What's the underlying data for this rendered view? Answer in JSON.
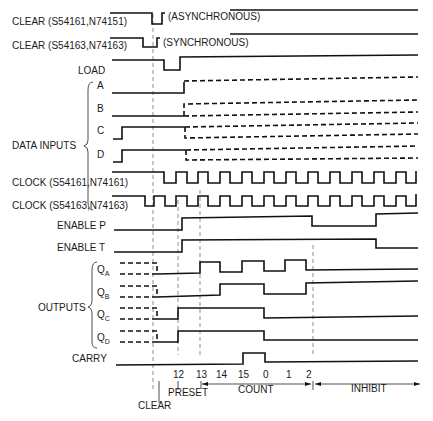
{
  "signals": {
    "clear_async": {
      "label": "CLEAR (S54161,N74151)",
      "note": "(ASYNCHRONOUS)"
    },
    "clear_sync": {
      "label": "CLEAR (S54163,N74163)",
      "note": "(SYNCHRONOUS)"
    },
    "load": {
      "label": "LOAD"
    },
    "data_inputs": {
      "group_label": "DATA INPUTS",
      "items": [
        "A",
        "B",
        "C",
        "D"
      ]
    },
    "clock_161": {
      "label": "CLOCK (S54161,N74161)"
    },
    "clock_163": {
      "label": "CLOCK (S54163,N74163)"
    },
    "enable_p": {
      "label": "ENABLE P"
    },
    "enable_t": {
      "label": "ENABLE T"
    },
    "outputs": {
      "group_label": "OUTPUTS",
      "items": [
        {
          "main": "Q",
          "sub": "A"
        },
        {
          "main": "Q",
          "sub": "B"
        },
        {
          "main": "Q",
          "sub": "C"
        },
        {
          "main": "Q",
          "sub": "D"
        }
      ]
    },
    "carry": {
      "label": "CARRY"
    }
  },
  "axis": {
    "counts": [
      "12",
      "13",
      "14",
      "15",
      "0",
      "1",
      "2"
    ],
    "phases": {
      "clear": "CLEAR",
      "preset": "PRESET",
      "count": "COUNT",
      "inhibit": "INHIBIT"
    }
  }
}
